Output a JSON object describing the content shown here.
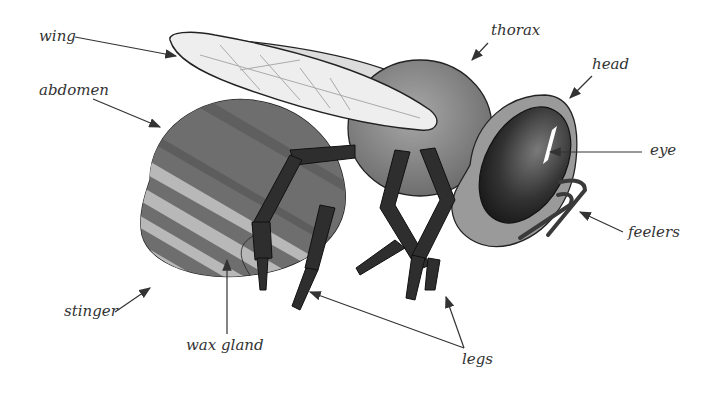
{
  "diagram": {
    "labels": {
      "wing": "wing",
      "abdomen": "abdomen",
      "thorax": "thorax",
      "head": "head",
      "eye": "eye",
      "feelers": "feelers",
      "stinger": "stinger",
      "wax_gland": "wax gland",
      "legs": "legs"
    },
    "colors": {
      "background": "#ffffff",
      "label_text": "#333333",
      "arrow": "#333333",
      "body_dark": "#3a3a3a",
      "body_mid": "#7a7a7a",
      "body_light": "#b5b5b5",
      "wing_fill": "#eeeeee"
    }
  }
}
